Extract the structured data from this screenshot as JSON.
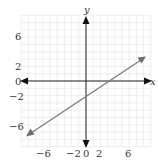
{
  "chart_data": {
    "type": "line",
    "title": "",
    "xlabel": "x",
    "ylabel": "y",
    "xlim": [
      -9,
      9
    ],
    "ylim": [
      -9,
      9
    ],
    "grid": true,
    "x_ticks": [
      "-6",
      "-2",
      "0",
      "2",
      "6"
    ],
    "y_ticks": [
      "6",
      "2",
      "0",
      "-2",
      "-6"
    ],
    "series": [
      {
        "name": "y = (2/3)x - 2",
        "x": [
          -8,
          8
        ],
        "y": [
          -7.33,
          3.33
        ],
        "arrows": "both"
      }
    ],
    "annotations": [],
    "colors": {
      "line": "#7a7a7a",
      "axis": "#333333",
      "grid": "#e0e0e0"
    }
  },
  "labels": {
    "x_axis": "x",
    "y_axis": "y",
    "xticks": {
      "t0": "−6",
      "t1": "−2",
      "t2": "0",
      "t3": "2",
      "t4": "6"
    },
    "yticks": {
      "t0": "6",
      "t1": "2",
      "t2": "0",
      "t3": "−2",
      "t4": "−6"
    }
  }
}
